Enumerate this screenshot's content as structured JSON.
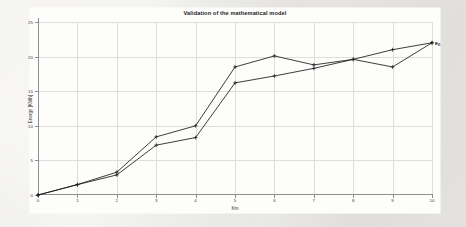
{
  "chart_data": {
    "type": "line",
    "title": "Validation of the mathematical model",
    "xlabel": "Km",
    "ylabel": "Energy [KWh]",
    "xlim": [
      0,
      10
    ],
    "ylim": [
      0,
      25
    ],
    "xticks": [
      "0",
      "1",
      "2",
      "3",
      "4",
      "5",
      "6",
      "7",
      "8",
      "9",
      "10"
    ],
    "yticks": [
      "0",
      "5",
      "10",
      "15",
      "20",
      "25"
    ],
    "grid": true,
    "legend_position": "end-of-line",
    "x": [
      0,
      1,
      2,
      3,
      4,
      5,
      6,
      7,
      8,
      9,
      10
    ],
    "series": [
      {
        "name": "E_C",
        "label_text": "E",
        "label_sub": "C",
        "color": "#1b1b1b",
        "marker": "plus",
        "values": [
          0,
          1.5,
          3.3,
          8.4,
          10.0,
          18.5,
          20.1,
          18.8,
          19.6,
          18.5,
          22.0
        ]
      },
      {
        "name": "E_R",
        "label_text": "E",
        "label_sub": "R",
        "color": "#1b1b1b",
        "marker": "plus",
        "values": [
          0,
          1.5,
          2.9,
          7.2,
          8.3,
          16.2,
          17.2,
          18.3,
          19.6,
          21.0,
          22.0
        ]
      }
    ]
  }
}
